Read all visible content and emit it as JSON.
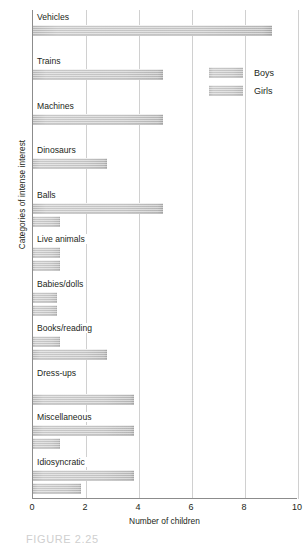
{
  "chart_data": {
    "type": "bar",
    "orientation": "horizontal",
    "title": "",
    "xlabel": "Number of children",
    "ylabel": "Categories of intense interest",
    "xlim": [
      0,
      10
    ],
    "xticks": [
      0,
      2,
      4,
      6,
      8,
      10
    ],
    "grid": true,
    "legend_position": "top-right",
    "categories": [
      "Vehicles",
      "Trains",
      "Machines",
      "Dinosaurs",
      "Balls",
      "Live animals",
      "Babies/dolls",
      "Books/reading",
      "Dress-ups",
      "Miscellaneous",
      "Idiosyncratic"
    ],
    "series": [
      {
        "name": "Boys",
        "values": [
          9.0,
          4.9,
          4.9,
          2.8,
          4.9,
          1.0,
          0.9,
          1.0,
          0.0,
          3.8,
          3.8
        ]
      },
      {
        "name": "Girls",
        "values": [
          0.0,
          0.0,
          0.0,
          0.0,
          1.0,
          1.0,
          0.9,
          2.8,
          3.8,
          1.0,
          1.8
        ]
      }
    ]
  },
  "axis": {
    "x_title": "Number of children",
    "y_title": "Categories of intense interest",
    "x_tick_labels": [
      "0",
      "2",
      "4",
      "6",
      "8",
      "10"
    ]
  },
  "legend": {
    "items": [
      {
        "label": "Boys"
      },
      {
        "label": "Girls"
      }
    ]
  },
  "caption": {
    "text": "FIGURE 2.25"
  }
}
